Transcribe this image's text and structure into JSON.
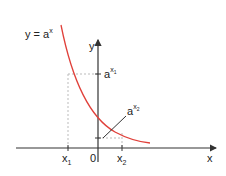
{
  "diagram": {
    "function_label": "y = a",
    "function_exp": "x",
    "axes": {
      "x_label": "x",
      "y_label": "y",
      "origin_label": "0"
    },
    "points": {
      "x1": {
        "base": "x",
        "sub": "1"
      },
      "x2": {
        "base": "x",
        "sub": "2"
      },
      "ax1": {
        "base": "a",
        "exp": "x",
        "exp_sub": "1"
      },
      "ax2": {
        "base": "a",
        "exp": "x",
        "exp_sub": "2"
      }
    },
    "colors": {
      "curve": "#e0403a",
      "axis": "#333333",
      "dashed": "#bbbbbb",
      "text": "#222222"
    }
  }
}
